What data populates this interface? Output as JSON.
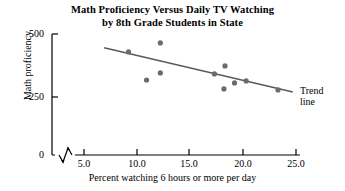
{
  "chart_data": {
    "type": "scatter",
    "title": "Math Proficiency Versus Daily TV Watching by 8th Grade Students in State",
    "title_line1": "Math Proficiency Versus Daily TV Watching",
    "title_line2": "by 8th Grade Students in State",
    "xlabel": "Percent watching 6 hours or more per day",
    "ylabel": "Math proficiency",
    "xlim": [
      4.0,
      25.0
    ],
    "ylim": [
      0,
      500
    ],
    "xticks": [
      "5.0",
      "10.0",
      "15.0",
      "20.0",
      "25.0"
    ],
    "xtick_values": [
      5.0,
      10.0,
      15.0,
      20.0,
      25.0
    ],
    "yticks": [
      "0",
      "250",
      "500"
    ],
    "ytick_values": [
      0,
      250,
      500
    ],
    "grid": false,
    "axis_break": true,
    "legend_position": "none",
    "marker_color": "#6b6b6b",
    "line_color": "#5a5a5a",
    "points": [
      {
        "x": 9.2,
        "y": 426
      },
      {
        "x": 12.2,
        "y": 463
      },
      {
        "x": 10.9,
        "y": 310
      },
      {
        "x": 12.2,
        "y": 339
      },
      {
        "x": 17.3,
        "y": 335
      },
      {
        "x": 18.3,
        "y": 368
      },
      {
        "x": 18.2,
        "y": 273
      },
      {
        "x": 19.2,
        "y": 298
      },
      {
        "x": 20.3,
        "y": 306
      },
      {
        "x": 23.3,
        "y": 269
      }
    ],
    "series": [
      {
        "name": "Trend line",
        "type": "line",
        "x": [
          6.9,
          24.7
        ],
        "values": [
          443,
          260
        ]
      }
    ],
    "annotations": [
      {
        "text": "Trend",
        "text2": "line",
        "x": 24.9,
        "y": 230
      }
    ]
  }
}
